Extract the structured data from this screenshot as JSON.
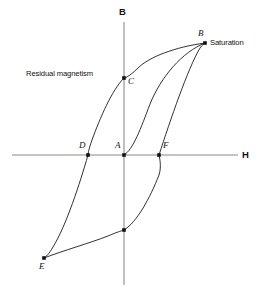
{
  "figure": {
    "background_color": "#ffffff",
    "curve_color": "#1a1a1a",
    "axis_color": "#8a8a8a",
    "text_color": "#111111"
  },
  "axes": {
    "vertical": {
      "label": "B",
      "name": "magnetic-flux-density"
    },
    "horizontal": {
      "label": "H",
      "name": "magnetic-field-strength"
    }
  },
  "annotations": {
    "saturation": "Saturation",
    "residual_magnetism": "Residual magnetism"
  },
  "points": {
    "a": "A",
    "b": "B",
    "c": "C",
    "d": "D",
    "e": "E",
    "f": "F"
  },
  "chart_data": {
    "type": "line",
    "xlabel": "H",
    "ylabel": "B",
    "grid": false,
    "legend": "none",
    "origin_px": [
      124,
      155
    ],
    "labeled_points": [
      {
        "label": "A",
        "role": "origin / unmagnetized state",
        "px": [
          124,
          155
        ]
      },
      {
        "label": "B",
        "role": "positive saturation",
        "px": [
          205,
          43
        ]
      },
      {
        "label": "C",
        "role": "residual magnetism (remanence)",
        "px": [
          124,
          78
        ]
      },
      {
        "label": "D",
        "role": "coercivity (negative H)",
        "px": [
          88,
          155
        ]
      },
      {
        "label": "E",
        "role": "negative saturation",
        "px": [
          44,
          258
        ]
      },
      {
        "label": "F",
        "role": "coercivity (positive H)",
        "px": [
          159,
          155
        ]
      },
      {
        "label": "",
        "role": "negative remanence (unlabeled)",
        "px": [
          124,
          230
        ]
      }
    ],
    "series": [
      {
        "name": "initial magnetization curve",
        "path": "M124,155 C133,150 141,128 150,104 C161,77 182,52 205,43"
      },
      {
        "name": "descending branch (B to E)",
        "path": "M205,43 C175,47 149,57 138,68 C128,78 124,78 124,78 C112,90 100,118 92,140 C88,151 88,155 88,155 C80,183 66,226 53,247 C49,254 46,257 44,258"
      },
      {
        "name": "ascending branch (E to B)",
        "path": "M44,258 C62,251 90,243 108,236 C117,232 124,230 124,230 C137,222 150,198 159,175 C162,166 159,155 159,155 C170,121 188,68 200,48 C202,45 204,44 205,43"
      }
    ]
  }
}
